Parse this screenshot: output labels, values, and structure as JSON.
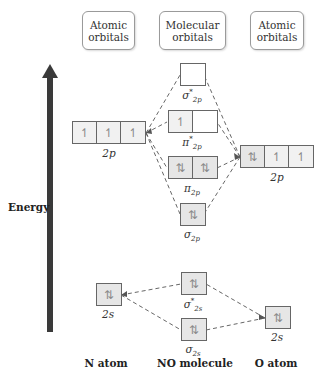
{
  "headers": {
    "left": [
      "Atomic",
      "orbitals"
    ],
    "middle": [
      "Molecular",
      "orbitals"
    ],
    "right": [
      "Atomic",
      "orbitals"
    ]
  },
  "axis": {
    "label": "Energy",
    "direction": "up",
    "color": "#3a3a3a"
  },
  "n_atom": {
    "label": "N atom",
    "orbitals": [
      {
        "name": "2p",
        "cells": [
          "↿",
          "↿",
          "↿"
        ]
      },
      {
        "name": "2s",
        "cells": [
          "⇅"
        ]
      }
    ]
  },
  "o_atom": {
    "label": "O atom",
    "orbitals": [
      {
        "name": "2p",
        "cells": [
          "⇅",
          "↿",
          "↿"
        ]
      },
      {
        "name": "2s",
        "cells": [
          "⇅"
        ]
      }
    ]
  },
  "molecule": {
    "label": "NO molecule",
    "orbitals": [
      {
        "symbol": "σ",
        "sub": "2p",
        "star": true,
        "cells": [
          ""
        ]
      },
      {
        "symbol": "π",
        "sub": "2p",
        "star": true,
        "cells": [
          "↿",
          ""
        ]
      },
      {
        "symbol": "π",
        "sub": "2p",
        "star": false,
        "cells": [
          "⇅",
          "⇅"
        ]
      },
      {
        "symbol": "σ",
        "sub": "2p",
        "star": false,
        "cells": [
          "⇅"
        ]
      },
      {
        "symbol": "σ",
        "sub": "2s",
        "star": true,
        "cells": [
          "⇅"
        ]
      },
      {
        "symbol": "σ",
        "sub": "2s",
        "star": false,
        "cells": [
          "⇅"
        ]
      }
    ]
  },
  "colors": {
    "line": "#555555",
    "filled_box": "#e6e6e6",
    "arrow": "#3a3a3a"
  }
}
